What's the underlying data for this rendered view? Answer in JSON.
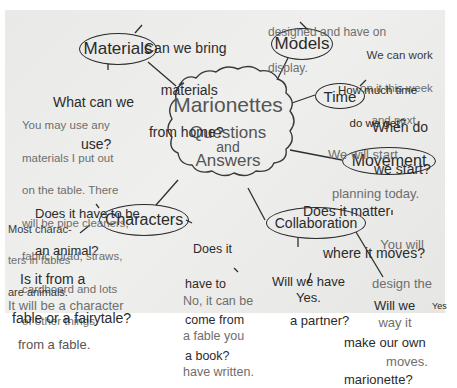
{
  "center": {
    "title": "Marionettes",
    "line2": "Questions",
    "line3": "and",
    "line4": "Answers"
  },
  "nodes": {
    "materials": "Materials",
    "models": "Models",
    "time": "Time",
    "movement": "Movement",
    "collaboration": "Collaboration",
    "characters": "Characters"
  },
  "materials": {
    "q1": [
      "Can we bring",
      "materials",
      "from home?"
    ],
    "q2": [
      "What can we",
      "use?"
    ],
    "a2": [
      "You may use any",
      "materials I put out",
      "on the table. There",
      "will be pipe cleaners,",
      "fabric, brad, straws,",
      "cardboard and lots",
      "of other things."
    ]
  },
  "models": {
    "a_top": [
      "designed and have on",
      "display."
    ]
  },
  "time": {
    "q1": [
      "How much time",
      "do we get?"
    ],
    "a1": [
      "We can work",
      "on it this week",
      "and next."
    ],
    "q2": [
      "When do",
      "we start?"
    ],
    "a2": [
      "We will start",
      "planning today."
    ]
  },
  "movement": {
    "q1": [
      "Does it matter",
      "where it moves?"
    ],
    "a1": [
      "You will",
      "design the",
      "way it",
      "moves."
    ]
  },
  "collaboration": {
    "q1": [
      "Will we have",
      "a partner?"
    ],
    "a1": "Yes.",
    "q2": [
      "Will we",
      "make our own",
      "marionette?"
    ],
    "a2": "Yes"
  },
  "characters": {
    "q1": [
      "Does it have to be",
      "an animal?"
    ],
    "a1": [
      "Most charac-",
      "ters in fables",
      "are animals."
    ],
    "q2": [
      "Is it from a",
      "fable or a fairytale?"
    ],
    "a2": [
      "It will be a character",
      "from a fable."
    ],
    "q3": [
      "Does it",
      "have to",
      "come from",
      "a book?"
    ],
    "a3": [
      "No, it can be",
      "a fable you",
      "have written."
    ]
  }
}
